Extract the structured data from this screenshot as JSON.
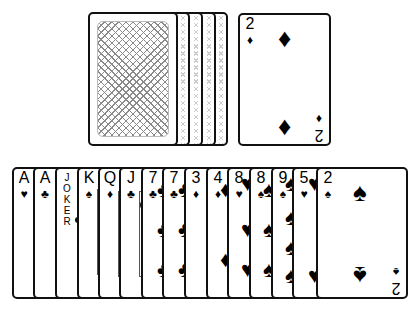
{
  "deck": {
    "label": "draw-pile",
    "stack_count": 5,
    "back_pattern": "crosshatch"
  },
  "discard": {
    "rank": "2",
    "suit": "♦",
    "suit_name": "diamonds"
  },
  "hand": {
    "cards": [
      {
        "rank": "A",
        "suit": "♥",
        "suit_name": "hearts"
      },
      {
        "rank": "A",
        "suit": "♣",
        "suit_name": "clubs"
      },
      {
        "rank": "JOKER",
        "suit": "",
        "suit_name": "joker"
      },
      {
        "rank": "K",
        "suit": "♠",
        "suit_name": "spades"
      },
      {
        "rank": "Q",
        "suit": "♦",
        "suit_name": "diamonds"
      },
      {
        "rank": "J",
        "suit": "♣",
        "suit_name": "clubs"
      },
      {
        "rank": "7",
        "suit": "♣",
        "suit_name": "clubs"
      },
      {
        "rank": "7",
        "suit": "♣",
        "suit_name": "clubs"
      },
      {
        "rank": "3",
        "suit": "♦",
        "suit_name": "diamonds"
      },
      {
        "rank": "4",
        "suit": "♦",
        "suit_name": "diamonds"
      },
      {
        "rank": "8",
        "suit": "♥",
        "suit_name": "hearts"
      },
      {
        "rank": "8",
        "suit": "♠",
        "suit_name": "spades"
      },
      {
        "rank": "9",
        "suit": "♠",
        "suit_name": "spades"
      },
      {
        "rank": "5",
        "suit": "♥",
        "suit_name": "hearts"
      },
      {
        "rank": "2",
        "suit": "♠",
        "suit_name": "spades"
      }
    ]
  },
  "joker_letters": [
    "J",
    "O",
    "K",
    "E",
    "R"
  ]
}
